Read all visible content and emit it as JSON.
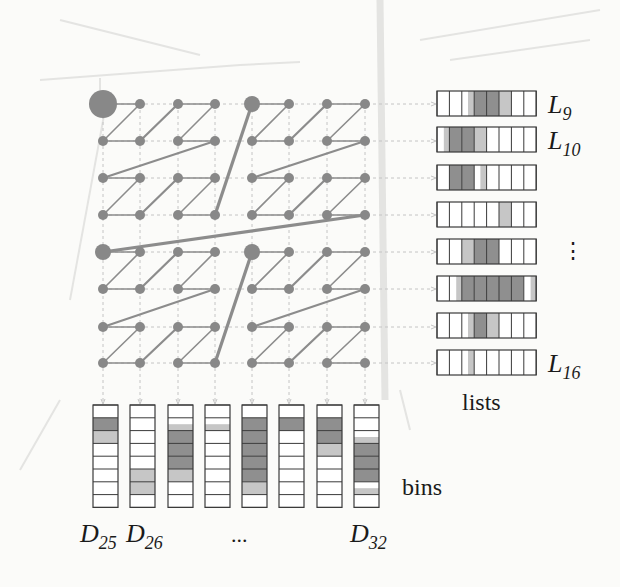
{
  "colors": {
    "node": "#888888",
    "edge": "#8c8c8c",
    "grid_dash": "#c4c4c4",
    "cell_dark": "#8f8f8f",
    "cell_light": "#c6c6c6",
    "cell_border": "#3a3a3a",
    "background": "#fbfbf9",
    "bleed": "#e4e4e2"
  },
  "grid": {
    "size": 8,
    "cols_x": [
      103,
      140,
      178,
      215,
      252,
      289,
      327,
      365
    ],
    "rows_y": [
      104,
      141,
      178,
      215,
      252,
      289,
      327,
      363
    ],
    "node_radius": 5,
    "block16_radius": 8,
    "root_radius": 14
  },
  "lists": {
    "x": 437,
    "cell_w": 12.4,
    "h": 25,
    "rows_y": [
      91,
      127,
      165,
      202,
      239,
      276,
      313,
      350
    ],
    "cells": [
      [
        0,
        0,
        0.5,
        2,
        2,
        1,
        0,
        0
      ],
      [
        0.3,
        2,
        2,
        1,
        0,
        0,
        0,
        0
      ],
      [
        0,
        2,
        2,
        0.5,
        0,
        0,
        0,
        0
      ],
      [
        0,
        0,
        0,
        0,
        0,
        1,
        0,
        0
      ],
      [
        0,
        0,
        1,
        2,
        2,
        0,
        0,
        0
      ],
      [
        0,
        0.3,
        2,
        2,
        2,
        2,
        2,
        0.2
      ],
      [
        0,
        0,
        0.5,
        2,
        1,
        0,
        0,
        0
      ],
      [
        0,
        0,
        0.5,
        0,
        0,
        0,
        0,
        0
      ]
    ],
    "labels": [
      {
        "row": 0,
        "main": "L",
        "sub": "9"
      },
      {
        "row": 1,
        "main": "L",
        "sub": "10"
      },
      {
        "row": 7,
        "main": "L",
        "sub": "16"
      }
    ],
    "ellipsis": "⋮",
    "caption": "lists"
  },
  "bins": {
    "cols_x": [
      93,
      130,
      168,
      205,
      242,
      279,
      317,
      354
    ],
    "w": 25,
    "y": 405,
    "cell_h": 12.8,
    "cells": [
      [
        0,
        2,
        1,
        0,
        0,
        0,
        0,
        0
      ],
      [
        0,
        0,
        0,
        0,
        0,
        1,
        1,
        0
      ],
      [
        0,
        0.5,
        2,
        2,
        2,
        1,
        0,
        0
      ],
      [
        0,
        0.5,
        0,
        0,
        0,
        0,
        0,
        0
      ],
      [
        0,
        2,
        2,
        2,
        2,
        2,
        1,
        0
      ],
      [
        0,
        2,
        0,
        0,
        0,
        0,
        0,
        0
      ],
      [
        0,
        2,
        2,
        1,
        0,
        0,
        0,
        0
      ],
      [
        0,
        0,
        0.5,
        2,
        2,
        2,
        0.5,
        0
      ]
    ],
    "labels": [
      {
        "x": 80,
        "main": "D",
        "sub": "25"
      },
      {
        "x": 126,
        "main": "D",
        "sub": "26"
      },
      {
        "x": 350,
        "main": "D",
        "sub": "32"
      }
    ],
    "ellipsis": "...",
    "caption": "bins"
  }
}
